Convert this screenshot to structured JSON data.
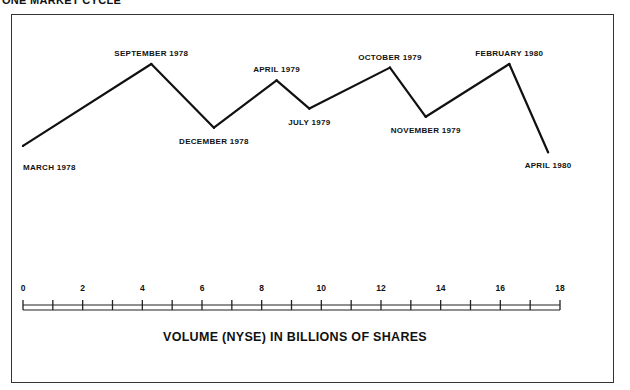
{
  "chart_data": {
    "type": "line",
    "title": "ONE MARKET CYCLE",
    "xlabel": "VOLUME (NYSE) IN BILLIONS OF SHARES",
    "ylabel": "",
    "xlim": [
      0,
      18
    ],
    "x_ticks": [
      0,
      2,
      4,
      6,
      8,
      10,
      12,
      14,
      16,
      18
    ],
    "x_minor_step": 1,
    "y_axis_shown": false,
    "grid": false,
    "legend": "none",
    "series": [
      {
        "name": "Market cycle",
        "points": [
          {
            "label": "MARCH 1978",
            "x": 0.0,
            "y": 0.1,
            "label_pos": "below-right"
          },
          {
            "label": "SEPTEMBER 1978",
            "x": 4.3,
            "y": 1.0,
            "label_pos": "above"
          },
          {
            "label": "DECEMBER 1978",
            "x": 6.4,
            "y": 0.3,
            "label_pos": "below"
          },
          {
            "label": "APRIL 1979",
            "x": 8.5,
            "y": 0.82,
            "label_pos": "above"
          },
          {
            "label": "JULY 1979",
            "x": 9.6,
            "y": 0.51,
            "label_pos": "below"
          },
          {
            "label": "OCTOBER 1979",
            "x": 12.3,
            "y": 0.96,
            "label_pos": "above"
          },
          {
            "label": "NOVEMBER 1979",
            "x": 13.5,
            "y": 0.42,
            "label_pos": "below"
          },
          {
            "label": "FEBRUARY 1980",
            "x": 16.3,
            "y": 1.0,
            "label_pos": "above"
          },
          {
            "label": "APRIL 1980",
            "x": 17.6,
            "y": 0.03,
            "label_pos": "below"
          }
        ]
      }
    ]
  }
}
